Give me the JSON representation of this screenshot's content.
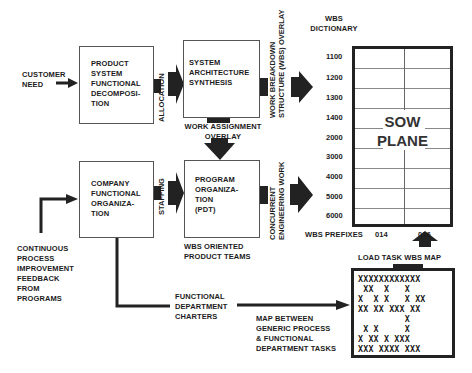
{
  "diagram": {
    "inputs": {
      "customer_need": [
        "CUSTOMER",
        "NEED"
      ],
      "feedback": [
        "CONTINUOUS",
        "PROCESS",
        "IMPROVEMENT",
        "FEEDBACK",
        "FROM",
        "PROGRAMS"
      ]
    },
    "boxes": {
      "product_decomp": [
        "PRODUCT",
        "SYSTEM",
        "FUNCTIONAL",
        "DECOMPOSI-",
        "TION"
      ],
      "system_arch": [
        "SYSTEM",
        "ARCHITECTURE",
        "SYNTHESIS"
      ],
      "company_org": [
        "COMPANY",
        "FUNCTIONAL",
        "ORGANIZA-",
        "TION"
      ],
      "program_org": [
        "PROGRAM",
        "ORGANIZA-",
        "TION",
        "(PDT)"
      ]
    },
    "arrow_labels": {
      "allocation": "ALLOCATION",
      "staffing": "STAFFING",
      "work_assignment": [
        "WORK ASSIGNMENT",
        "OVERLAY"
      ],
      "wbs_overlay": [
        "WORK BREAKDOWN",
        "STRUCTURE (WBS) OVERLAY"
      ],
      "concurrent": [
        "CONCURRENT",
        "ENGINEERING WORK"
      ],
      "load_task": "LOAD TASK WBS MAP"
    },
    "captions": {
      "wbs_oriented": [
        "WBS ORIENTED",
        "PRODUCT TEAMS"
      ],
      "functional_charters": [
        "FUNCTIONAL",
        "DEPARTMENT",
        "CHARTERS"
      ],
      "map_between": [
        "MAP BETWEEN",
        "GENERIC PROCESS",
        "& FUNCTIONAL",
        "DEPARTMENT TASKS"
      ]
    },
    "sow_plane": {
      "dictionary_label": [
        "WBS",
        "DICTIONARY"
      ],
      "title": [
        "SOW",
        "PLANE"
      ],
      "rows": [
        "1100",
        "1200",
        "1300",
        "1400",
        "2000",
        "3000",
        "4000",
        "5000",
        "6000"
      ],
      "prefix_label": "WBS PREFIXES",
      "prefixes": [
        "014",
        "016"
      ]
    },
    "task_matrix": {
      "rows": [
        "XXXXXXXXXXXX",
        " XX  X   X  ",
        "X  X X   X XX",
        "XX XX XXX XX",
        "         X  ",
        " X X     X  ",
        "X XX X XXX  ",
        "XXX XXXX XXX"
      ]
    }
  }
}
